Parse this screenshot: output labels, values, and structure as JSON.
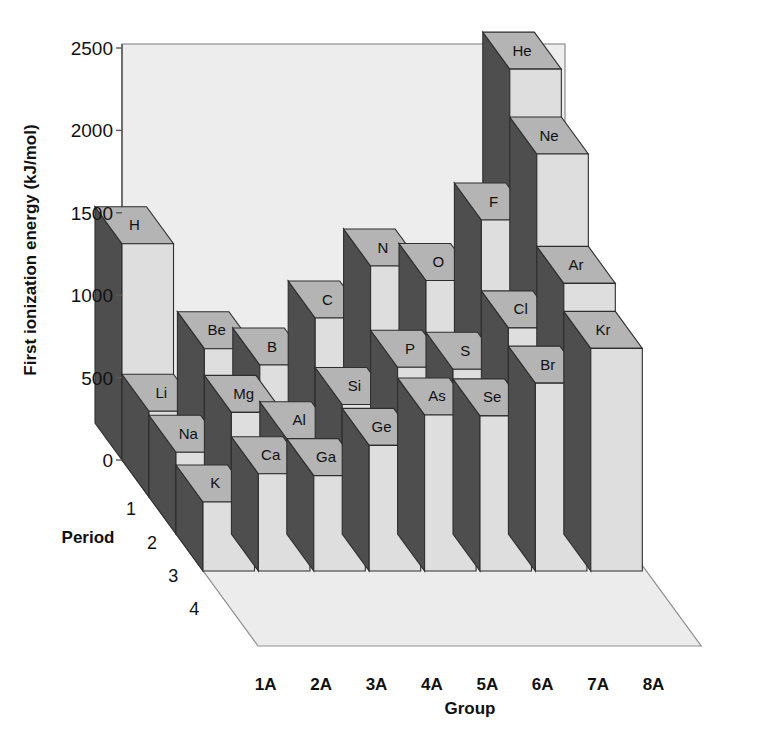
{
  "figure": {
    "kind": "3d-bar-chart",
    "background_color": "#ffffff",
    "panel_color": "#ededed",
    "floor_color": "#ececec",
    "outline_color": "#3a3a3a"
  },
  "axes": {
    "y": {
      "title": "First ionization energy (kJ/mol)",
      "ticks": [
        "0",
        "500",
        "1000",
        "1500",
        "2000",
        "2500"
      ],
      "min": 0,
      "max": 2500,
      "step": 500
    },
    "x": {
      "title": "Group",
      "ticks": [
        "1A",
        "2A",
        "3A",
        "4A",
        "5A",
        "6A",
        "7A",
        "8A"
      ]
    },
    "z": {
      "title": "Period",
      "ticks": [
        "1",
        "2",
        "3",
        "4"
      ]
    }
  },
  "colors": {
    "front_face": "#dedede",
    "top_face": "#b4b4b4",
    "side_face_dark": "#4e4e4e",
    "side_face_light": "#9a9a9a",
    "edge": "#2e2e2e"
  },
  "bleed_text": {
    "line1": "ation energy increases from left to right",
    "line2": "increases from lithium to fluorine",
    "heading": "Electronegativity and Electron Affinity",
    "line3": "The electronegativity of an atom is a measure of the",
    "line4": "nt bond. The most widely used scale of electronegativities",
    "line5": "ng Pauling.",
    "line6": "Noble gases are not assigned electronegativity values.",
    "line7": "bonding. With the exception of the noble gases"
  },
  "chart_data": {
    "type": "bar",
    "title": "",
    "xlabel": "Group",
    "ylabel": "First ionization energy (kJ/mol)",
    "zlabel": "Period",
    "ylim": [
      0,
      2500
    ],
    "grid": false,
    "legend": "none",
    "categories": [
      "1A",
      "2A",
      "3A",
      "4A",
      "5A",
      "6A",
      "7A",
      "8A"
    ],
    "periods": [
      "1",
      "2",
      "3",
      "4"
    ],
    "series": [
      {
        "name": "1",
        "values": [
          1312,
          null,
          null,
          null,
          null,
          null,
          null,
          2372
        ],
        "labels": [
          "H",
          null,
          null,
          null,
          null,
          null,
          null,
          "He"
        ]
      },
      {
        "name": "2",
        "values": [
          520,
          900,
          801,
          1086,
          1402,
          1314,
          1681,
          2081
        ],
        "labels": [
          "Li",
          "Be",
          "B",
          "C",
          "N",
          "O",
          "F",
          "Ne"
        ]
      },
      {
        "name": "3",
        "values": [
          496,
          738,
          578,
          786,
          1012,
          1000,
          1251,
          1521
        ],
        "labels": [
          "Na",
          "Mg",
          "Al",
          "Si",
          "P",
          "S",
          "Cl",
          "Ar"
        ]
      },
      {
        "name": "4",
        "values": [
          419,
          590,
          579,
          762,
          947,
          941,
          1140,
          1351
        ],
        "labels": [
          "K",
          "Ca",
          "Ga",
          "Ge",
          "As",
          "Se",
          "Br",
          "Kr"
        ]
      }
    ]
  }
}
